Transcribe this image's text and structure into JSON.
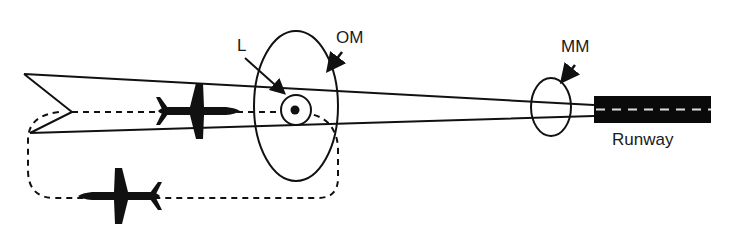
{
  "diagram": {
    "labels": {
      "locator": "L",
      "outer_marker": "OM",
      "middle_marker": "MM",
      "runway": "Runway"
    },
    "elements": [
      {
        "id": "localizer-beam",
        "type": "converging lines (approach course)"
      },
      {
        "id": "outer-marker-fan",
        "type": "ellipse",
        "label": "OM"
      },
      {
        "id": "locator-beacon",
        "type": "circle with dot",
        "label": "L"
      },
      {
        "id": "middle-marker-fan",
        "type": "ellipse",
        "label": "MM"
      },
      {
        "id": "runway",
        "type": "black rectangle with dashed centerline",
        "label": "Runway"
      },
      {
        "id": "procedure-turn-path",
        "type": "dashed racetrack flight path"
      },
      {
        "id": "aircraft-inbound",
        "type": "aircraft icon heading toward runway"
      },
      {
        "id": "aircraft-outbound",
        "type": "aircraft icon heading away from runway"
      }
    ],
    "colors": {
      "line": "#111111",
      "background": "#ffffff",
      "runway": "#0a0a0a",
      "runway_centerline": "#dddddd"
    }
  }
}
